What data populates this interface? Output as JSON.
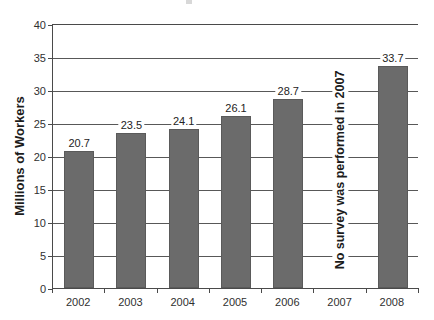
{
  "chart_data": {
    "type": "bar",
    "title": "",
    "xlabel": "",
    "ylabel": "Millions of Workers",
    "categories": [
      "2002",
      "2003",
      "2004",
      "2005",
      "2006",
      "2007",
      "2008"
    ],
    "values": [
      20.7,
      23.5,
      24.1,
      26.1,
      28.7,
      null,
      33.7
    ],
    "value_labels": [
      "20.7",
      "23.5",
      "24.1",
      "26.1",
      "28.7",
      "",
      "33.7"
    ],
    "ylim": [
      0,
      40
    ],
    "yticks": [
      0,
      5,
      10,
      15,
      20,
      25,
      30,
      35,
      40
    ],
    "ytick_labels": [
      "0",
      "5",
      "10",
      "15",
      "20",
      "25",
      "30",
      "35",
      "40"
    ],
    "grid": true,
    "grid_axis": "y",
    "legend": false,
    "legend_position": "none",
    "series": [
      {
        "name": "Millions of Workers",
        "values": [
          20.7,
          23.5,
          24.1,
          26.1,
          28.7,
          null,
          33.7
        ]
      }
    ],
    "annotations": [
      {
        "text": "No survey was performed in 2007",
        "category": "2007",
        "rotation": 90,
        "bold": true
      }
    ],
    "colors": {
      "bar_fill": "#6b6b6b",
      "bar_stroke": "#5a5a5a",
      "axis": "#4a4a4a",
      "grid": "#585858",
      "text": "#2b2b2b",
      "background": "#ffffff"
    }
  }
}
